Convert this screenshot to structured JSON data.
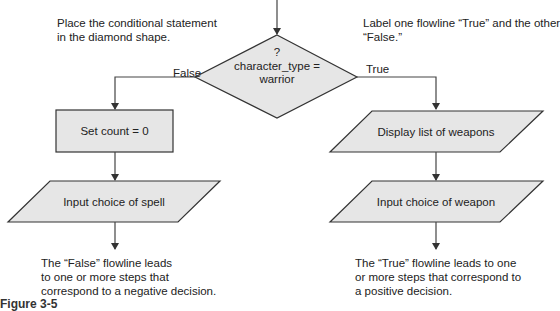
{
  "notes": {
    "top_left": [
      "Place the conditional statement",
      "in the diamond shape."
    ],
    "top_right": [
      "Label one flowline “True” and the other",
      "“False.”"
    ],
    "bottom_left": [
      "The “False” flowline leads",
      "to one or more steps that",
      "correspond to a negative decision."
    ],
    "bottom_right": [
      "The “True” flowline leads to one",
      "or more steps that correspond to",
      "a positive decision."
    ]
  },
  "decision": {
    "line1": "?",
    "line2": "character_type =",
    "line3": "warrior"
  },
  "branches": {
    "false_label": "False",
    "true_label": "True"
  },
  "false_branch": {
    "process": "Set count = 0",
    "input": "Input choice of spell"
  },
  "true_branch": {
    "output": "Display list of weapons",
    "input": "Input choice of weapon"
  },
  "figure_caption": "Figure 3-5",
  "colors": {
    "shape_fill": "#e6e6e6",
    "stroke": "#333333",
    "text": "#222222"
  }
}
